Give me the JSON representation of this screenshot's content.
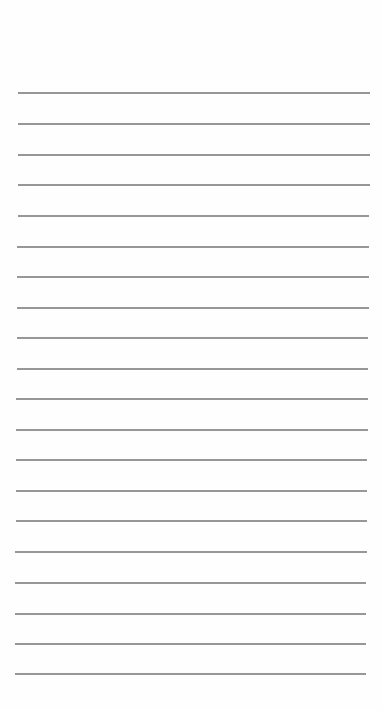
{
  "page": {
    "type": "lined-paper",
    "background_color": "#fefefe",
    "line_color": "#8c8c8c",
    "line_count": 20,
    "lines": [
      {
        "y": 92,
        "x1": 18,
        "x2": 370
      },
      {
        "y": 123,
        "x1": 18,
        "x2": 370
      },
      {
        "y": 154,
        "x1": 18,
        "x2": 370
      },
      {
        "y": 184,
        "x1": 18,
        "x2": 370
      },
      {
        "y": 215,
        "x1": 18,
        "x2": 369
      },
      {
        "y": 246,
        "x1": 17,
        "x2": 369
      },
      {
        "y": 276,
        "x1": 17,
        "x2": 369
      },
      {
        "y": 307,
        "x1": 17,
        "x2": 369
      },
      {
        "y": 337,
        "x1": 17,
        "x2": 368
      },
      {
        "y": 368,
        "x1": 17,
        "x2": 368
      },
      {
        "y": 398,
        "x1": 16,
        "x2": 368
      },
      {
        "y": 429,
        "x1": 16,
        "x2": 368
      },
      {
        "y": 459,
        "x1": 16,
        "x2": 367
      },
      {
        "y": 490,
        "x1": 16,
        "x2": 367
      },
      {
        "y": 520,
        "x1": 16,
        "x2": 367
      },
      {
        "y": 551,
        "x1": 15,
        "x2": 367
      },
      {
        "y": 582,
        "x1": 15,
        "x2": 366
      },
      {
        "y": 613,
        "x1": 15,
        "x2": 366
      },
      {
        "y": 643,
        "x1": 15,
        "x2": 366
      },
      {
        "y": 673,
        "x1": 15,
        "x2": 366
      }
    ]
  }
}
